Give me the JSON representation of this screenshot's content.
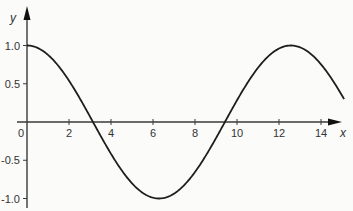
{
  "chart_data": {
    "type": "line",
    "title": "",
    "xlabel": "x",
    "ylabel": "y",
    "function": "y = cos(x/2)",
    "xlim": [
      0,
      15
    ],
    "ylim": [
      -1.0,
      1.0
    ],
    "x_ticks": [
      0,
      2,
      4,
      6,
      8,
      10,
      12,
      14
    ],
    "x_tick_labels": [
      "0",
      "2",
      "4",
      "6",
      "8",
      "10",
      "12",
      "14"
    ],
    "y_ticks": [
      1.0,
      0.5,
      -0.5,
      -1.0
    ],
    "y_tick_labels": [
      "1.0",
      "0.5",
      "-0.5",
      "-1.0"
    ],
    "grid": false,
    "legend": null,
    "series": [
      {
        "name": "cos(x/2)",
        "x": [
          0,
          1,
          2,
          3,
          3.14,
          4,
          5,
          6,
          6.28,
          7,
          8,
          9,
          9.42,
          10,
          11,
          12,
          12.57,
          13,
          14,
          15
        ],
        "values": [
          1.0,
          0.88,
          0.54,
          0.07,
          0.0,
          -0.42,
          -0.8,
          -0.99,
          -1.0,
          -0.94,
          -0.65,
          -0.21,
          0.0,
          0.28,
          0.71,
          0.96,
          1.0,
          0.98,
          0.75,
          0.35
        ]
      }
    ],
    "colors": {
      "curve": "#1e1e1e",
      "axes": "#3a3a3a",
      "background": "#fbfbfa"
    }
  }
}
